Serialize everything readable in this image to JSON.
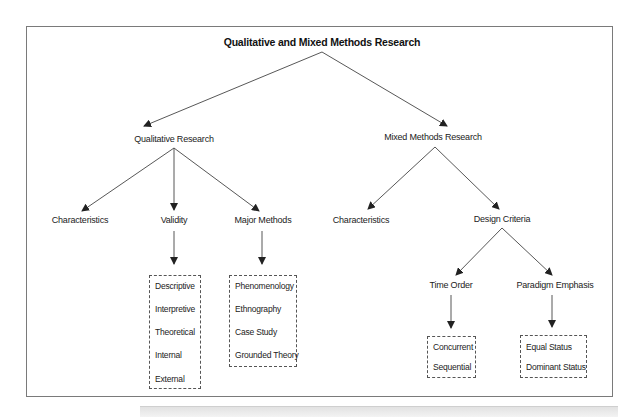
{
  "diagram": {
    "title": "Qualitative and Mixed Methods Research",
    "qualitative": {
      "label": "Qualitative Research",
      "children": {
        "characteristics": "Characteristics",
        "validity": "Validity",
        "major_methods": "Major Methods"
      },
      "validity_types": [
        "Descriptive",
        "Interpretive",
        "Theoretical",
        "Internal",
        "External"
      ],
      "methods": [
        "Phenomenology",
        "Ethnography",
        "Case Study",
        "Grounded Theory"
      ]
    },
    "mixed": {
      "label": "Mixed Methods Research",
      "children": {
        "characteristics": "Characteristics",
        "design_criteria": "Design Criteria"
      },
      "design_criteria": {
        "time_order": "Time Order",
        "paradigm_emphasis": "Paradigm Emphasis"
      },
      "time_order_options": [
        "Concurrent",
        "Sequential"
      ],
      "paradigm_options": [
        "Equal Status",
        "Dominant Status"
      ]
    }
  },
  "colors": {
    "line": "#444444",
    "frame": "#7a7a7a",
    "text": "#222222"
  }
}
